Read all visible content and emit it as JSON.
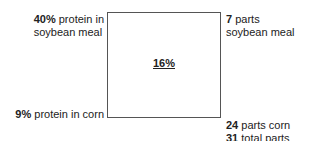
{
  "diagram": {
    "type": "pearson-square",
    "center": {
      "value": "16%"
    },
    "top_left": {
      "bold": "40%",
      "text": " protein in",
      "line2": "soybean meal"
    },
    "bottom_left": {
      "bold": "9%",
      "text": " protein in corn"
    },
    "top_right": {
      "bold": "7",
      "text": " parts",
      "line2": "soybean meal"
    },
    "bottom_right": {
      "bold": "24",
      "text": " parts corn",
      "bold2": "31",
      "text2": " total parts"
    }
  }
}
